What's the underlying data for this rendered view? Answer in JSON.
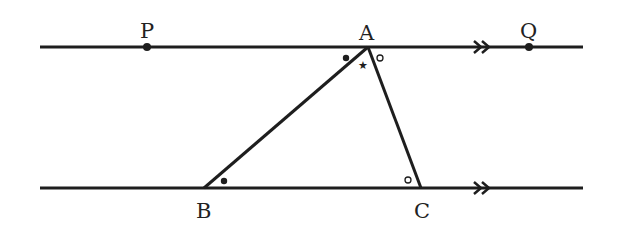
{
  "diagram": {
    "type": "geometry",
    "colors": {
      "stroke": "#1e1e1e",
      "background": "#ffffff"
    },
    "labels": {
      "P": "P",
      "A": "A",
      "Q": "Q",
      "B": "B",
      "C": "C"
    },
    "points": {
      "P": {
        "x": 147,
        "y": 47
      },
      "A": {
        "x": 368,
        "y": 47
      },
      "Q": {
        "x": 529,
        "y": 47
      },
      "B": {
        "x": 204,
        "y": 188
      },
      "C": {
        "x": 421,
        "y": 188
      }
    },
    "lines": {
      "top": {
        "x1": 40,
        "x2": 583,
        "y": 47,
        "arrow_x": 480
      },
      "bottom": {
        "x1": 40,
        "x2": 583,
        "y": 188,
        "arrow_x": 480
      }
    },
    "angle_marks": {
      "PAB": "dot",
      "ABC": "dot",
      "BAC": "star",
      "QAC": "circle",
      "ACB": "circle"
    },
    "marks_text": {
      "star": "★"
    }
  }
}
